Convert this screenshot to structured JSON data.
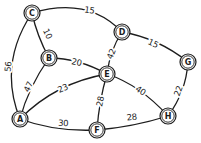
{
  "canvas": {
    "width": 201,
    "height": 143,
    "background": "#ffffff",
    "ink": "#1d1d1d"
  },
  "diagram": {
    "type": "weighted-undirected-graph",
    "nodes": [
      {
        "id": "A",
        "x": 20,
        "y": 119
      },
      {
        "id": "B",
        "x": 49,
        "y": 58
      },
      {
        "id": "C",
        "x": 32,
        "y": 13
      },
      {
        "id": "D",
        "x": 122,
        "y": 32
      },
      {
        "id": "E",
        "x": 107,
        "y": 74
      },
      {
        "id": "F",
        "x": 97,
        "y": 130
      },
      {
        "id": "G",
        "x": 188,
        "y": 62
      },
      {
        "id": "H",
        "x": 168,
        "y": 116
      }
    ],
    "edges": [
      {
        "from": "A",
        "to": "B",
        "weight": "47",
        "cx": 28,
        "cy": 88,
        "lx": 31,
        "ly": 88,
        "lr": -65
      },
      {
        "from": "A",
        "to": "C",
        "weight": "56",
        "cx": -2,
        "cy": 64,
        "lx": 11,
        "ly": 67,
        "lr": -84
      },
      {
        "from": "A",
        "to": "E",
        "weight": "23",
        "cx": 55,
        "cy": 83,
        "lx": 64,
        "ly": 91,
        "lr": -24
      },
      {
        "from": "A",
        "to": "F",
        "weight": "30",
        "cx": 55,
        "cy": 132,
        "lx": 63,
        "ly": 126,
        "lr": 3
      },
      {
        "from": "B",
        "to": "C",
        "weight": "10",
        "cx": 37,
        "cy": 36,
        "lx": 45,
        "ly": 35,
        "lr": 65
      },
      {
        "from": "B",
        "to": "E",
        "weight": "20",
        "cx": 78,
        "cy": 58,
        "lx": 76,
        "ly": 65,
        "lr": 12
      },
      {
        "from": "C",
        "to": "D",
        "weight": "15",
        "cx": 88,
        "cy": -4,
        "lx": 89,
        "ly": 13,
        "lr": 8
      },
      {
        "from": "D",
        "to": "E",
        "weight": "42",
        "cx": 110,
        "cy": 50,
        "lx": 114,
        "ly": 55,
        "lr": -68
      },
      {
        "from": "D",
        "to": "G",
        "weight": "15",
        "cx": 158,
        "cy": 38,
        "lx": 152,
        "ly": 46,
        "lr": 25
      },
      {
        "from": "E",
        "to": "F",
        "weight": "28",
        "cx": 99,
        "cy": 101,
        "lx": 103,
        "ly": 102,
        "lr": -78
      },
      {
        "from": "E",
        "to": "H",
        "weight": "40",
        "cx": 140,
        "cy": 85,
        "lx": 139,
        "ly": 93,
        "lr": 33
      },
      {
        "from": "F",
        "to": "H",
        "weight": "28",
        "cx": 133,
        "cy": 127,
        "lx": 132,
        "ly": 120,
        "lr": -6
      },
      {
        "from": "G",
        "to": "H",
        "weight": "22",
        "cx": 186,
        "cy": 92,
        "lx": 181,
        "ly": 92,
        "lr": -70
      }
    ],
    "node_style": {
      "outer_radius": 8,
      "inner_radius": 6.2,
      "fill": "#ffffff"
    },
    "edge_style": {
      "stroke_width": 1.3
    }
  }
}
